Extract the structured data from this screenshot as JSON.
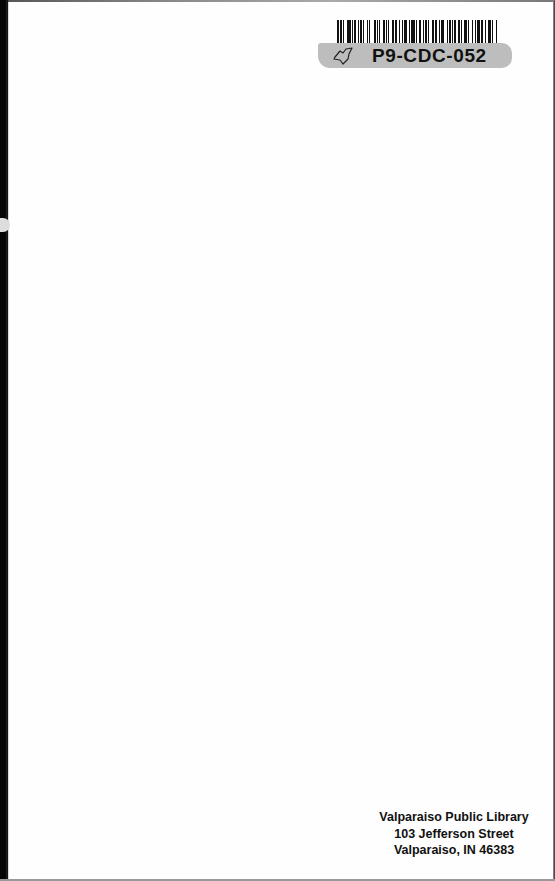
{
  "document": {
    "type": "library book back endpaper",
    "background_color": "#fefefe"
  },
  "barcode_sticker": {
    "code": "P9-CDC-052",
    "icon": "state-map-outline-icon",
    "band_color": "#bdbdbd",
    "bar_pattern": [
      2,
      1,
      1,
      1,
      1,
      3,
      3,
      1,
      1,
      1,
      2,
      1,
      1,
      1,
      2,
      1,
      1,
      2,
      1,
      1,
      1,
      3,
      2,
      1,
      1,
      1,
      1,
      2,
      2,
      1,
      1,
      1,
      1,
      2,
      2,
      1,
      2,
      1,
      1,
      2,
      1,
      1,
      2,
      2,
      1,
      1,
      3,
      1,
      1,
      2,
      2,
      1,
      1,
      1,
      2,
      1,
      1,
      2,
      2,
      1,
      2,
      1,
      1,
      1,
      3,
      2,
      1,
      1,
      2,
      1,
      1,
      1,
      1,
      2,
      2,
      1,
      1,
      1,
      3,
      1,
      1,
      2,
      1,
      2,
      1,
      1,
      2,
      1,
      2,
      2,
      1,
      1,
      3,
      1,
      1,
      2,
      1,
      1
    ]
  },
  "library_stamp": {
    "line1": "Valparaiso Public Library",
    "line2": "103 Jefferson Street",
    "line3": "Valparaiso, IN 46383"
  }
}
